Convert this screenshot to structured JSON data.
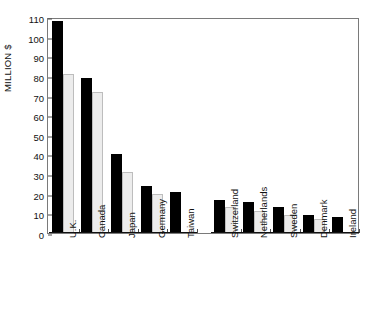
{
  "chart_data": {
    "type": "bar",
    "title": "",
    "xlabel": "",
    "ylabel": "MILLION $",
    "ylim": [
      0,
      110
    ],
    "ytick_step": 10,
    "yticks": [
      0,
      10,
      20,
      30,
      40,
      50,
      60,
      70,
      80,
      90,
      100,
      110
    ],
    "grid": false,
    "legend_position": "top-center",
    "categories": [
      "U.K.",
      "Canada",
      "Japan",
      "Germany",
      "Taiwan",
      "Switzerland",
      "Netherlands",
      "Sweden",
      "Denmark",
      "Ireland"
    ],
    "series": [
      {
        "name": "1997",
        "color": "#000000",
        "values": [
          108,
          79,
          40,
          24,
          21,
          17,
          16,
          13,
          9,
          8
        ]
      },
      {
        "name": "1996",
        "color": "#ececec",
        "values": [
          81,
          72,
          31,
          20,
          null,
          13,
          11,
          9,
          7,
          null
        ]
      }
    ]
  },
  "legend": {
    "items": [
      {
        "label": "1997",
        "swatch": "black-swatch"
      },
      {
        "label": "1996",
        "swatch": "gray-swatch"
      }
    ]
  }
}
